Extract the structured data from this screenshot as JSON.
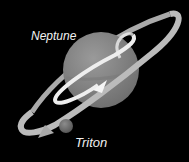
{
  "diagram": {
    "labels": {
      "planet": "Neptune",
      "moon": "Triton"
    },
    "colors": {
      "background": "#000000",
      "planet": "#8a8a8a",
      "ring": "#b8b8b8",
      "orbit_arrow": "#f0f0f0",
      "moon": "#7a7a7a",
      "text": "#f2f2f2"
    }
  }
}
